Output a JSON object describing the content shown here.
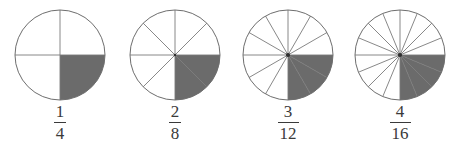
{
  "figure": {
    "background_color": "#ffffff",
    "circle_outline_color": "#6e6e6e",
    "divider_color": "#7a7a7a",
    "shaded_color": "#6b6b6b",
    "unshaded_color": "#ffffff",
    "text_color": "#3a3a3a",
    "center_dot_color": "#2f2f2f"
  },
  "chart_data": {
    "type": "pie",
    "charts": [
      {
        "label": "1/4",
        "numerator": "1",
        "denominator": "4",
        "total_sectors": 4,
        "shaded_sectors": 1,
        "shaded_fraction": 0.25,
        "center_x": 60,
        "center_y": 55,
        "radius": 45,
        "center_dot": false
      },
      {
        "label": "2/8",
        "numerator": "2",
        "denominator": "8",
        "total_sectors": 8,
        "shaded_sectors": 2,
        "shaded_fraction": 0.25,
        "center_x": 175,
        "center_y": 55,
        "radius": 45,
        "center_dot": true
      },
      {
        "label": "3/12",
        "numerator": "3",
        "denominator": "12",
        "total_sectors": 12,
        "shaded_sectors": 3,
        "shaded_fraction": 0.25,
        "center_x": 288,
        "center_y": 55,
        "radius": 45,
        "center_dot": true
      },
      {
        "label": "4/16",
        "numerator": "4",
        "denominator": "16",
        "total_sectors": 16,
        "shaded_sectors": 4,
        "shaded_fraction": 0.25,
        "center_x": 400,
        "center_y": 55,
        "radius": 45,
        "center_dot": true
      }
    ]
  }
}
